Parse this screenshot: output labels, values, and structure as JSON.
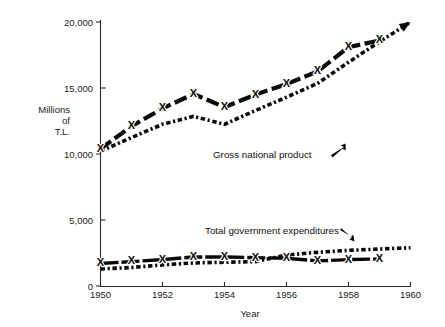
{
  "chart_data": {
    "type": "line",
    "title": "",
    "xlabel": "Year",
    "ylabel": "Millions of T.L.",
    "ylabel_lines": [
      "Millions",
      "of",
      "T.L."
    ],
    "xlim": [
      1950,
      1960
    ],
    "ylim": [
      0,
      20000
    ],
    "grid": false,
    "legend_position": "inline-annotations",
    "x_ticks": [
      "1950",
      "1952",
      "1954",
      "1956",
      "1958",
      "1960"
    ],
    "x_tick_values": [
      1950,
      1952,
      1954,
      1956,
      1958,
      1960
    ],
    "y_ticks": [
      "0",
      "5,000",
      "10,000",
      "15,000",
      "20,000"
    ],
    "y_tick_values": [
      0,
      5000,
      10000,
      15000,
      20000
    ],
    "x": [
      1950,
      1951,
      1952,
      1953,
      1954,
      1955,
      1956,
      1957,
      1958,
      1959,
      1960
    ],
    "series": [
      {
        "name": "Gross national product (marked series)",
        "style": "heavy-dashed-with-x-markers",
        "marker": "X",
        "x": [
          1950,
          1951,
          1952,
          1953,
          1954,
          1955,
          1956,
          1957,
          1958,
          1959
        ],
        "values": [
          10400,
          12100,
          13450,
          14550,
          13550,
          14500,
          15300,
          16250,
          18100,
          18600
        ]
      },
      {
        "name": "Gross national product (dotted series)",
        "style": "dotted",
        "marker": "none",
        "arrow_end": true,
        "x": [
          1950,
          1951,
          1952,
          1953,
          1954,
          1955,
          1956,
          1957,
          1958,
          1959,
          1960
        ],
        "values": [
          10200,
          11250,
          12250,
          12850,
          12250,
          13300,
          14300,
          15350,
          16950,
          18500,
          20000
        ]
      },
      {
        "name": "Total government expenditures (marked series)",
        "style": "heavy-solid-with-x-markers",
        "marker": "X",
        "x": [
          1950,
          1951,
          1952,
          1953,
          1954,
          1955,
          1956,
          1957,
          1958,
          1959
        ],
        "values": [
          1700,
          1850,
          2000,
          2200,
          2200,
          2150,
          2100,
          1900,
          2000,
          2050
        ]
      },
      {
        "name": "Total government expenditures (dotted series)",
        "style": "dotted",
        "marker": "none",
        "x": [
          1950,
          1951,
          1952,
          1953,
          1954,
          1955,
          1956,
          1957,
          1958,
          1959,
          1960
        ],
        "values": [
          1300,
          1400,
          1600,
          1750,
          1800,
          1850,
          2350,
          2550,
          2700,
          2800,
          2900
        ]
      }
    ],
    "annotations": [
      {
        "label": "Gross national product",
        "arrow": "arrow-up-right",
        "x_px": 213,
        "y_px": 155
      },
      {
        "label": "Total government expenditures",
        "arrow": "arrow-down-right",
        "x_px": 205,
        "y_px": 231
      }
    ]
  }
}
